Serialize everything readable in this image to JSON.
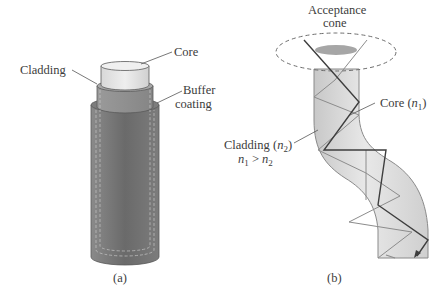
{
  "figure": {
    "panel_a": {
      "caption": "(a)",
      "labels": {
        "core": "Core",
        "cladding": "Cladding",
        "buffer_line1": "Buffer",
        "buffer_line2": "coating"
      },
      "colors": {
        "core": "#e2e2e2",
        "cladding": "#8c8c8c",
        "buffer": "#6e6e6e"
      }
    },
    "panel_b": {
      "caption": "(b)",
      "labels": {
        "acceptance_line1": "Acceptance",
        "acceptance_line2": "cone",
        "core_prefix": "Core (",
        "core_var": "n",
        "core_sub": "1",
        "core_suffix": ")",
        "cladding_prefix": "Cladding (",
        "cladding_var": "n",
        "cladding_sub": "2",
        "cladding_suffix": ")",
        "ineq_left_var": "n",
        "ineq_left_sub": "1",
        "ineq_op": " > ",
        "ineq_right_var": "n",
        "ineq_right_sub": "2"
      },
      "colors": {
        "fiber": "#dcdcdc",
        "outline": "#8a8a8a",
        "ray_dark": "#3e3e3e",
        "ray_light": "#8c8c8c"
      }
    }
  }
}
